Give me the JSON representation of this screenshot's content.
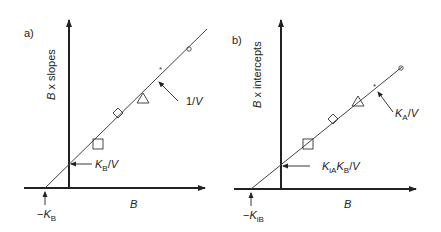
{
  "panels": [
    {
      "id": "a",
      "panel_label": "a)",
      "y_axis_label": "B x slopes",
      "x_axis_label": "B",
      "intercept_y_label": {
        "main": "K",
        "sub": "B",
        "suffix": "/V"
      },
      "intercept_x_label": {
        "prefix": "−K",
        "sub": "B"
      },
      "slope_label": "1/V",
      "markers": [
        "square",
        "diamond",
        "triangle",
        "star",
        "circle"
      ]
    },
    {
      "id": "b",
      "panel_label": "b)",
      "y_axis_label": "B x intercepts",
      "x_axis_label": "B",
      "intercept_y_label": {
        "main": "K",
        "sub1": "iA",
        "main2": "K",
        "sub2": "B",
        "suffix": "/V"
      },
      "intercept_x_label": {
        "prefix": "−K",
        "sub": "iB"
      },
      "slope_label": {
        "main": "K",
        "sub": "A",
        "suffix": "/V"
      },
      "markers": [
        "square",
        "diamond",
        "triangle",
        "star",
        "circle"
      ]
    }
  ],
  "colors": {
    "line": "#333333",
    "axis": "#222222",
    "text": "#222222"
  }
}
